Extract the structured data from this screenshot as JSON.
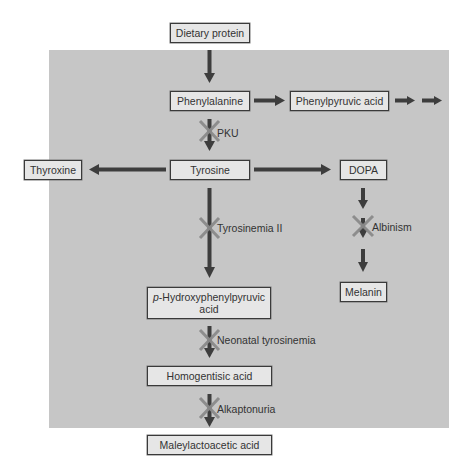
{
  "diagram": {
    "type": "metabolic-pathway",
    "title": "",
    "nodes": {
      "dietary_protein": "Dietary protein",
      "phenylalanine": "Phenylalanine",
      "phenylpyruvic_acid": "Phenylpyruvic acid",
      "tyrosine": "Tyrosine",
      "thyroxine": "Thyroxine",
      "dopa": "DOPA",
      "melanin": "Melanin",
      "p_hydroxyphenylpyruvic_prefix": "p",
      "p_hydroxyphenylpyruvic_line1": "-Hydroxyphenylpyruvic",
      "p_hydroxyphenylpyruvic_line2": "acid",
      "homogentisic_acid": "Homogentisic acid",
      "maleylactoacetic_acid": "Maleylactoacetic acid"
    },
    "blocks": {
      "pku": "PKU",
      "tyrosinemia_ii": "Tyrosinemia II",
      "albinism": "Albinism",
      "neonatal_tyrosinemia": "Neonatal tyrosinemia",
      "alkaptonuria": "Alkaptonuria"
    },
    "edges": [
      {
        "from": "Dietary protein",
        "to": "Phenylalanine",
        "blocked_by": null
      },
      {
        "from": "Phenylalanine",
        "to": "Phenylpyruvic acid",
        "blocked_by": null
      },
      {
        "from": "Phenylpyruvic acid",
        "to": "(further metabolites)",
        "blocked_by": null
      },
      {
        "from": "Phenylalanine",
        "to": "Tyrosine",
        "blocked_by": "PKU"
      },
      {
        "from": "Tyrosine",
        "to": "Thyroxine",
        "blocked_by": null
      },
      {
        "from": "Tyrosine",
        "to": "DOPA",
        "blocked_by": null
      },
      {
        "from": "DOPA",
        "to": "Melanin",
        "blocked_by": "Albinism"
      },
      {
        "from": "Tyrosine",
        "to": "p-Hydroxyphenylpyruvic acid",
        "blocked_by": "Tyrosinemia II"
      },
      {
        "from": "p-Hydroxyphenylpyruvic acid",
        "to": "Homogentisic acid",
        "blocked_by": "Neonatal tyrosinemia"
      },
      {
        "from": "Homogentisic acid",
        "to": "Maleylactoacetic acid",
        "blocked_by": "Alkaptonuria"
      }
    ],
    "colors": {
      "panel": "#c6c6c6",
      "node_fill": "#e6e6e6",
      "node_border": "#3a3a3a",
      "arrow": "#3d3d3d",
      "block_mark": "#8a8a8a"
    }
  }
}
